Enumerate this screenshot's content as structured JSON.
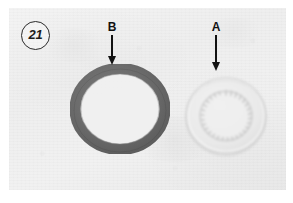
{
  "figure": {
    "number": "21",
    "badge_shape": "circle"
  },
  "photo": {
    "caption_labels": [
      "B",
      "A"
    ],
    "background_color": "#efefef",
    "border_color": "#ffffff"
  },
  "callouts": [
    {
      "id": "B",
      "label": "B",
      "points_to": "dark-clutch-plate",
      "arrow_direction": "down"
    },
    {
      "id": "A",
      "label": "A",
      "points_to": "pale-clutch-plate",
      "arrow_direction": "down"
    }
  ],
  "parts": [
    {
      "id": "part-b",
      "label": "B",
      "description": "dark steel clutch plate with external drive tabs",
      "color": "#6f6f6f",
      "tab_count": 12
    },
    {
      "id": "part-a",
      "label": "A",
      "description": "pale friction clutch plate with internal splines",
      "color": "#e3e3e3",
      "spline_count": 30
    }
  ],
  "colors": {
    "page_background": "#ffffff",
    "photo_background": "#efefef",
    "ink": "#121212",
    "part_b_ring": "#6f6f6f",
    "part_a_ring": "#e1e1e1"
  }
}
